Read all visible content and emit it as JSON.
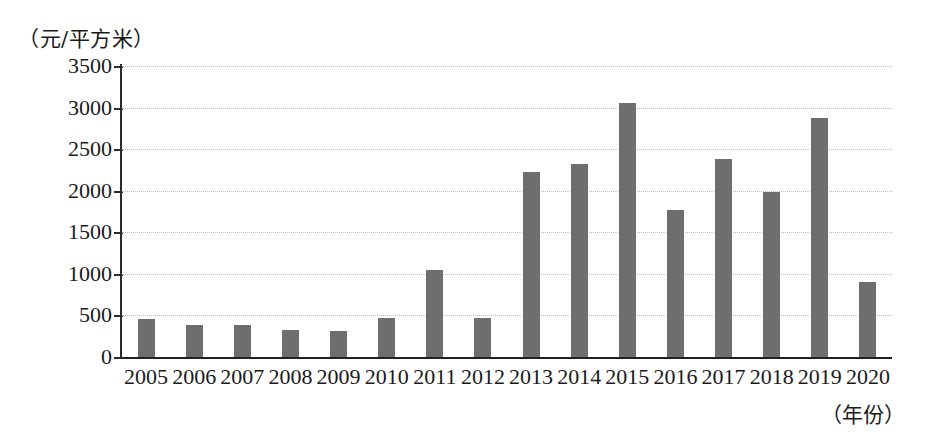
{
  "chart_data": {
    "type": "bar",
    "title": "",
    "subtitle": "",
    "xlabel": "（年份）",
    "ylabel": "（元/平方米）",
    "categories": [
      "2005",
      "2006",
      "2007",
      "2008",
      "2009",
      "2010",
      "2011",
      "2012",
      "2013",
      "2014",
      "2015",
      "2016",
      "2017",
      "2018",
      "2019",
      "2020"
    ],
    "values": [
      460,
      390,
      390,
      320,
      315,
      465,
      1050,
      470,
      2230,
      2320,
      3060,
      1770,
      2380,
      1990,
      2880,
      900
    ],
    "series": [
      {
        "name": "",
        "values": [
          460,
          390,
          390,
          320,
          315,
          465,
          1050,
          470,
          2230,
          2320,
          3060,
          1770,
          2380,
          1990,
          2880,
          900
        ]
      }
    ],
    "ylim": [
      0,
      3500
    ],
    "yticks": [
      0,
      500,
      1000,
      1500,
      2000,
      2500,
      3000,
      3500
    ],
    "ytick_labels": [
      "0",
      "500",
      "1000",
      "1500",
      "2000",
      "2500",
      "3000",
      "3500"
    ],
    "grid": true,
    "grid_axis": "y",
    "legend": false,
    "legend_position": "none",
    "bar_color": "#6e6e6e",
    "axis_color": "#2a2a2a",
    "gridline_color": "#b9b9bf",
    "background_color": "#ffffff"
  }
}
